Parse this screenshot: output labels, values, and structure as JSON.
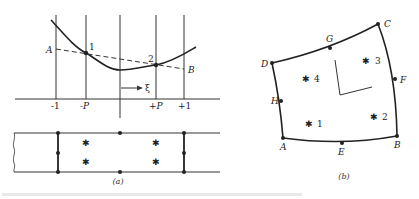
{
  "figure_a": {
    "caption": "(a)",
    "curve_labels": {
      "end_left": "A",
      "end_right": "B",
      "point1": "1",
      "point2": "2",
      "direction": "→ ξ"
    },
    "axis_ticks": [
      "-1",
      "-P",
      "+P",
      "+1"
    ],
    "strip": {
      "gauss_point_marker": "✱"
    }
  },
  "figure_b": {
    "caption": "(b)",
    "corner_nodes": [
      "A",
      "B",
      "C",
      "D"
    ],
    "midside_nodes": [
      "E",
      "F",
      "G",
      "H"
    ],
    "gauss_points": [
      "1",
      "2",
      "3",
      "4"
    ],
    "gauss_point_marker": "✱"
  },
  "footer": {
    "caption_text": ""
  }
}
